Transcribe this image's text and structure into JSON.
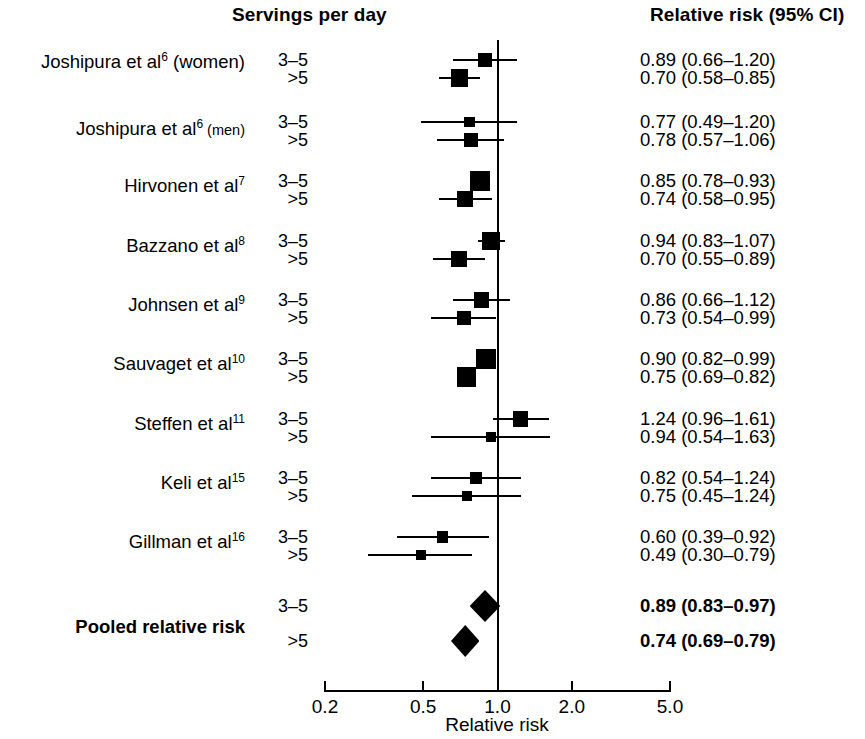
{
  "header": {
    "servings_label": "Servings per day",
    "rr_label": "Relative risk (95% CI)"
  },
  "axis": {
    "title": "Relative risk",
    "ticks": [
      "0.2",
      "0.5",
      "1.0",
      "2.0",
      "5.0"
    ],
    "tick_values": [
      0.2,
      0.5,
      1.0,
      2.0,
      5.0
    ],
    "scale": "log",
    "null_value": 1.0
  },
  "rows": [
    {
      "study": "Joshipura et al",
      "ref": "6",
      "suffix": " (women)",
      "suffix_small": false,
      "bold": false,
      "servings": "3–5",
      "rr_text": "0.89 (0.66–1.20)",
      "rr": 0.89,
      "lo": 0.66,
      "hi": 1.2
    },
    {
      "study": "",
      "ref": "",
      "suffix": "",
      "bold": false,
      "servings": ">5",
      "rr_text": "0.70 (0.58–0.85)",
      "rr": 0.7,
      "lo": 0.58,
      "hi": 0.85
    },
    {
      "study": "Joshipura et al",
      "ref": "6",
      "suffix": " (men)",
      "suffix_small": true,
      "bold": false,
      "servings": "3–5",
      "rr_text": "0.77 (0.49–1.20)",
      "rr": 0.77,
      "lo": 0.49,
      "hi": 1.2
    },
    {
      "study": "",
      "ref": "",
      "suffix": "",
      "bold": false,
      "servings": ">5",
      "rr_text": "0.78 (0.57–1.06)",
      "rr": 0.78,
      "lo": 0.57,
      "hi": 1.06
    },
    {
      "study": "Hirvonen et al",
      "ref": "7",
      "suffix": "",
      "bold": false,
      "servings": "3–5",
      "rr_text": "0.85 (0.78–0.93)",
      "rr": 0.85,
      "lo": 0.78,
      "hi": 0.93
    },
    {
      "study": "",
      "ref": "",
      "suffix": "",
      "bold": false,
      "servings": ">5",
      "rr_text": "0.74 (0.58–0.95)",
      "rr": 0.74,
      "lo": 0.58,
      "hi": 0.95
    },
    {
      "study": "Bazzano et al",
      "ref": "8",
      "suffix": "",
      "bold": false,
      "servings": "3–5",
      "rr_text": "0.94 (0.83–1.07)",
      "rr": 0.94,
      "lo": 0.83,
      "hi": 1.07
    },
    {
      "study": "",
      "ref": "",
      "suffix": "",
      "bold": false,
      "servings": ">5",
      "rr_text": "0.70 (0.55–0.89)",
      "rr": 0.7,
      "lo": 0.55,
      "hi": 0.89
    },
    {
      "study": "Johnsen et al",
      "ref": "9",
      "suffix": "",
      "bold": false,
      "servings": "3–5",
      "rr_text": "0.86 (0.66–1.12)",
      "rr": 0.86,
      "lo": 0.66,
      "hi": 1.12
    },
    {
      "study": "",
      "ref": "",
      "suffix": "",
      "bold": false,
      "servings": ">5",
      "rr_text": "0.73 (0.54–0.99)",
      "rr": 0.73,
      "lo": 0.54,
      "hi": 0.99
    },
    {
      "study": "Sauvaget et al",
      "ref": "10",
      "suffix": "",
      "bold": false,
      "servings": "3–5",
      "rr_text": "0.90 (0.82–0.99)",
      "rr": 0.9,
      "lo": 0.82,
      "hi": 0.99
    },
    {
      "study": "",
      "ref": "",
      "suffix": "",
      "bold": false,
      "servings": ">5",
      "rr_text": "0.75 (0.69–0.82)",
      "rr": 0.75,
      "lo": 0.69,
      "hi": 0.82
    },
    {
      "study": "Steffen et al",
      "ref": "11",
      "suffix": "",
      "bold": false,
      "servings": "3–5",
      "rr_text": "1.24 (0.96–1.61)",
      "rr": 1.24,
      "lo": 0.96,
      "hi": 1.61
    },
    {
      "study": "",
      "ref": "",
      "suffix": "",
      "bold": false,
      "servings": ">5",
      "rr_text": "0.94 (0.54–1.63)",
      "rr": 0.94,
      "lo": 0.54,
      "hi": 1.63
    },
    {
      "study": "Keli et al",
      "ref": "15",
      "suffix": "",
      "bold": false,
      "servings": "3–5",
      "rr_text": "0.82 (0.54–1.24)",
      "rr": 0.82,
      "lo": 0.54,
      "hi": 1.24
    },
    {
      "study": "",
      "ref": "",
      "suffix": "",
      "bold": false,
      "servings": ">5",
      "rr_text": "0.75 (0.45–1.24)",
      "rr": 0.75,
      "lo": 0.45,
      "hi": 1.24
    },
    {
      "study": "Gillman et al",
      "ref": "16",
      "suffix": "",
      "bold": false,
      "servings": "3–5",
      "rr_text": "0.60 (0.39–0.92)",
      "rr": 0.6,
      "lo": 0.39,
      "hi": 0.92
    },
    {
      "study": "",
      "ref": "",
      "suffix": "",
      "bold": false,
      "servings": ">5",
      "rr_text": "0.49 (0.30–0.79)",
      "rr": 0.49,
      "lo": 0.3,
      "hi": 0.79
    },
    {
      "study": "Pooled relative risk",
      "ref": "",
      "suffix": "",
      "bold": true,
      "servings": "3–5",
      "rr_text": "0.89 (0.83–0.97)",
      "rr": 0.89,
      "lo": 0.83,
      "hi": 0.97,
      "pooled": true
    },
    {
      "study": "",
      "ref": "",
      "suffix": "",
      "bold": true,
      "servings": ">5",
      "rr_text": "0.74 (0.69–0.79)",
      "rr": 0.74,
      "lo": 0.69,
      "hi": 0.79,
      "pooled": true
    }
  ],
  "chart_data": {
    "type": "scatter",
    "title": "",
    "xlabel": "Relative risk",
    "ylabel": "",
    "xscale": "log",
    "xlim": [
      0.2,
      5.0
    ],
    "xticks": [
      0.2,
      0.5,
      1.0,
      2.0,
      5.0
    ],
    "xticklabels": [
      "0.2",
      "0.5",
      "1.0",
      "2.0",
      "5.0"
    ],
    "grid": false,
    "legend": "none",
    "reference_line": 1.0,
    "columns": [
      "Study",
      "Servings per day",
      "Relative risk (95% CI)"
    ],
    "points": [
      {
        "study": "Joshipura et al6 (women)",
        "servings": "3–5",
        "rr": 0.89,
        "ci_low": 0.66,
        "ci_high": 1.2,
        "marker": "square"
      },
      {
        "study": "Joshipura et al6 (women)",
        "servings": ">5",
        "rr": 0.7,
        "ci_low": 0.58,
        "ci_high": 0.85,
        "marker": "square"
      },
      {
        "study": "Joshipura et al6 (men)",
        "servings": "3–5",
        "rr": 0.77,
        "ci_low": 0.49,
        "ci_high": 1.2,
        "marker": "square"
      },
      {
        "study": "Joshipura et al6 (men)",
        "servings": ">5",
        "rr": 0.78,
        "ci_low": 0.57,
        "ci_high": 1.06,
        "marker": "square"
      },
      {
        "study": "Hirvonen et al7",
        "servings": "3–5",
        "rr": 0.85,
        "ci_low": 0.78,
        "ci_high": 0.93,
        "marker": "square"
      },
      {
        "study": "Hirvonen et al7",
        "servings": ">5",
        "rr": 0.74,
        "ci_low": 0.58,
        "ci_high": 0.95,
        "marker": "square"
      },
      {
        "study": "Bazzano et al8",
        "servings": "3–5",
        "rr": 0.94,
        "ci_low": 0.83,
        "ci_high": 1.07,
        "marker": "square"
      },
      {
        "study": "Bazzano et al8",
        "servings": ">5",
        "rr": 0.7,
        "ci_low": 0.55,
        "ci_high": 0.89,
        "marker": "square"
      },
      {
        "study": "Johnsen et al9",
        "servings": "3–5",
        "rr": 0.86,
        "ci_low": 0.66,
        "ci_high": 1.12,
        "marker": "square"
      },
      {
        "study": "Johnsen et al9",
        "servings": ">5",
        "rr": 0.73,
        "ci_low": 0.54,
        "ci_high": 0.99,
        "marker": "square"
      },
      {
        "study": "Sauvaget et al10",
        "servings": "3–5",
        "rr": 0.9,
        "ci_low": 0.82,
        "ci_high": 0.99,
        "marker": "square"
      },
      {
        "study": "Sauvaget et al10",
        "servings": ">5",
        "rr": 0.75,
        "ci_low": 0.69,
        "ci_high": 0.82,
        "marker": "square"
      },
      {
        "study": "Steffen et al11",
        "servings": "3–5",
        "rr": 1.24,
        "ci_low": 0.96,
        "ci_high": 1.61,
        "marker": "square"
      },
      {
        "study": "Steffen et al11",
        "servings": ">5",
        "rr": 0.94,
        "ci_low": 0.54,
        "ci_high": 1.63,
        "marker": "square"
      },
      {
        "study": "Keli et al15",
        "servings": "3–5",
        "rr": 0.82,
        "ci_low": 0.54,
        "ci_high": 1.24,
        "marker": "square"
      },
      {
        "study": "Keli et al15",
        "servings": ">5",
        "rr": 0.75,
        "ci_low": 0.45,
        "ci_high": 1.24,
        "marker": "square"
      },
      {
        "study": "Gillman et al16",
        "servings": "3–5",
        "rr": 0.6,
        "ci_low": 0.39,
        "ci_high": 0.92,
        "marker": "square"
      },
      {
        "study": "Gillman et al16",
        "servings": ">5",
        "rr": 0.49,
        "ci_low": 0.3,
        "ci_high": 0.79,
        "marker": "square"
      },
      {
        "study": "Pooled relative risk",
        "servings": "3–5",
        "rr": 0.89,
        "ci_low": 0.83,
        "ci_high": 0.97,
        "marker": "diamond"
      },
      {
        "study": "Pooled relative risk",
        "servings": ">5",
        "rr": 0.74,
        "ci_low": 0.69,
        "ci_high": 0.79,
        "marker": "diamond"
      }
    ]
  }
}
